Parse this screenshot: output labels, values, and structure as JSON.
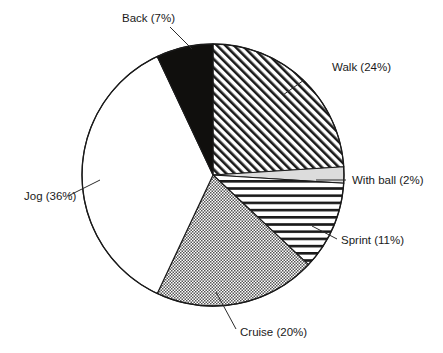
{
  "chart_data": {
    "type": "pie",
    "title": "",
    "subtitle": "",
    "xlabel": "",
    "ylabel": "",
    "grid": false,
    "legend_position": "none",
    "label_format": "{name} ({value}%)",
    "units": "percent",
    "total": 100,
    "categories": [
      "Walk",
      "With ball",
      "Sprint",
      "Cruise",
      "Jog",
      "Back"
    ],
    "values": [
      24,
      2,
      11,
      20,
      36,
      7
    ],
    "start_angle_deg": 0,
    "direction": "clockwise",
    "slices": [
      {
        "name": "Walk",
        "value": 24,
        "label": "Walk (24%)",
        "fill": "diagonal-hatch",
        "fill_color": "#1a1a1a",
        "start_deg": 0,
        "end_deg": 86.4,
        "label_x": 332,
        "label_y": 71,
        "leader_x1": 304,
        "leader_y1": 80,
        "leader_x2": 283,
        "leader_y2": 95,
        "anchor": "start"
      },
      {
        "name": "With ball",
        "value": 2,
        "label": "With ball (2%)",
        "fill": "light-gray",
        "fill_color": "#d6d6d6",
        "start_deg": 86.4,
        "end_deg": 93.6,
        "label_x": 352,
        "label_y": 184,
        "leader_x1": 346,
        "leader_y1": 180,
        "leader_x2": 316,
        "leader_y2": 180,
        "anchor": "start"
      },
      {
        "name": "Sprint",
        "value": 11,
        "label": "Sprint (11%)",
        "fill": "horizontal-lines",
        "fill_color": "#1a1a1a",
        "start_deg": 93.6,
        "end_deg": 133.2,
        "label_x": 341,
        "label_y": 244,
        "leader_x1": 337,
        "leader_y1": 239,
        "leader_x2": 312,
        "leader_y2": 226,
        "anchor": "start"
      },
      {
        "name": "Cruise",
        "value": 20,
        "label": "Cruise (20%)",
        "fill": "gray-checker",
        "fill_color": "#808080",
        "start_deg": 133.2,
        "end_deg": 205.2,
        "label_x": 240,
        "label_y": 336,
        "leader_x1": 236,
        "leader_y1": 329,
        "leader_x2": 216,
        "leader_y2": 292,
        "anchor": "start"
      },
      {
        "name": "Jog",
        "value": 36,
        "label": "Jog (36%)",
        "fill": "white",
        "fill_color": "#ffffff",
        "start_deg": 205.2,
        "end_deg": 334.8,
        "label_x": 24,
        "label_y": 200,
        "leader_x1": 68,
        "leader_y1": 196,
        "leader_x2": 100,
        "leader_y2": 180,
        "anchor": "start"
      },
      {
        "name": "Back",
        "value": 7,
        "label": "Back (7%)",
        "fill": "solid-black",
        "fill_color": "#100f0d",
        "start_deg": 334.8,
        "end_deg": 360,
        "label_x": 122,
        "label_y": 22,
        "leader_x1": 170,
        "leader_y1": 27,
        "leader_x2": 192,
        "leader_y2": 49,
        "anchor": "start"
      }
    ],
    "geometry": {
      "center_x": 213,
      "center_y": 175,
      "radius": 131
    }
  }
}
